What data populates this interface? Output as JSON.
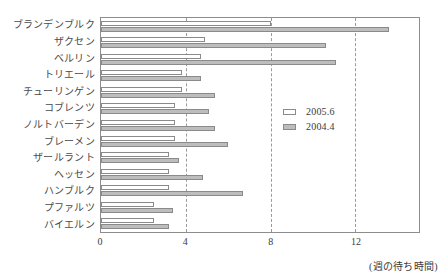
{
  "chart_data": {
    "type": "bar",
    "orientation": "horizontal",
    "title": "",
    "xlabel": "(週の待ち時間)",
    "ylabel": "",
    "xlim": [
      0,
      15
    ],
    "xticks": [
      0,
      4,
      8,
      12
    ],
    "grid": "vertical-dashed",
    "legend_position": "inside-right",
    "categories": [
      "ブランデンブルク",
      "ザクセン",
      "ベルリン",
      "トリエール",
      "チューリンゲン",
      "コブレンツ",
      "ノルトバーデン",
      "ブレーメン",
      "ザールラント",
      "ヘッセン",
      "ハンブルク",
      "プファルツ",
      "バイエルン"
    ],
    "series": [
      {
        "name": "2005.6",
        "color": "#ffffff",
        "values": [
          8.0,
          4.9,
          4.7,
          3.8,
          3.8,
          3.5,
          3.5,
          3.5,
          3.2,
          3.2,
          3.2,
          2.5,
          2.5
        ]
      },
      {
        "name": "2004.4",
        "color": "#bdbdbd",
        "values": [
          13.6,
          10.6,
          11.1,
          4.7,
          5.4,
          5.1,
          5.4,
          6.0,
          3.7,
          4.8,
          6.7,
          3.4,
          3.2
        ]
      }
    ]
  },
  "legend": {
    "items": [
      {
        "label": "2005.6",
        "swatch": "legend-swatch-2005"
      },
      {
        "label": "2004.4",
        "swatch": "legend-swatch-2004"
      }
    ]
  },
  "axis": {
    "tick_labels": [
      "0",
      "4",
      "8",
      "12"
    ],
    "unit_note": "(週の待ち時間)"
  }
}
